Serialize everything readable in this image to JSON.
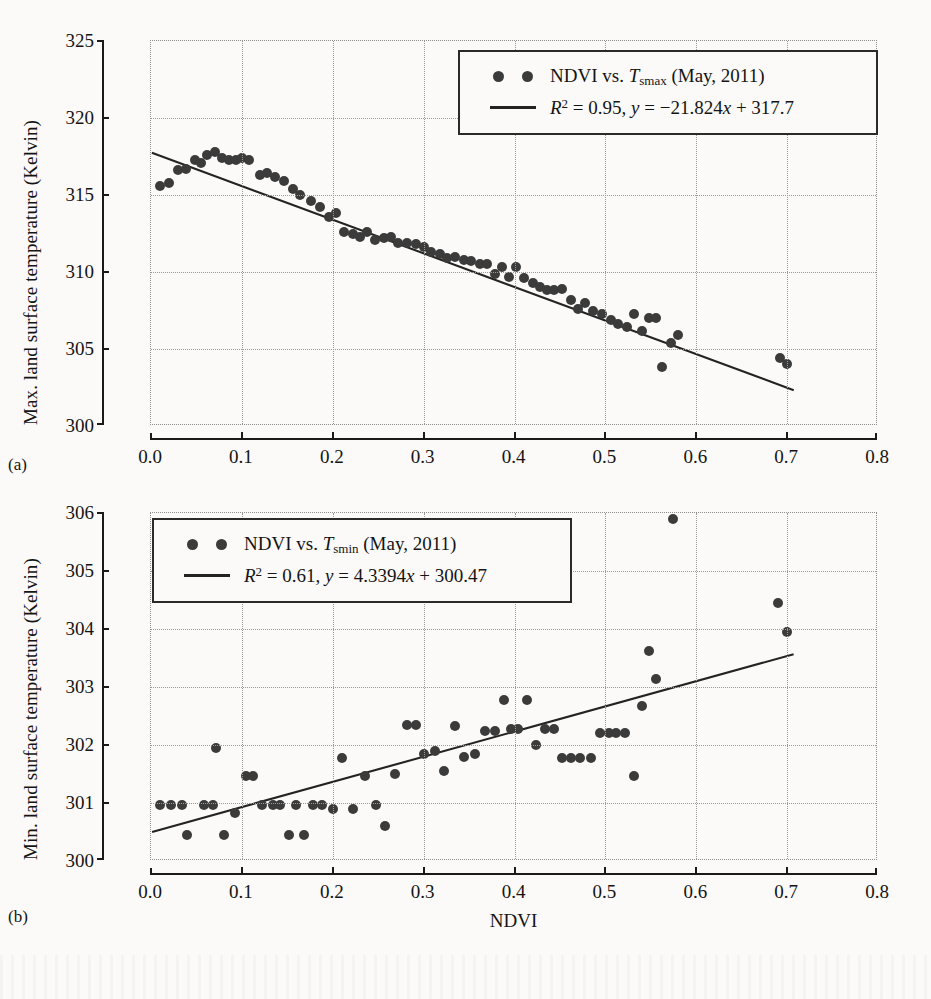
{
  "figure": {
    "background": "#fbfaf8",
    "marker_color": "#3b3b3b",
    "line_color": "#232323",
    "grid_color": "#9a9a9a",
    "panel_a_tag": "(a)",
    "panel_b_tag": "(b)"
  },
  "chart_data": [
    {
      "type": "scatter",
      "panel": "(a)",
      "title": "",
      "xlabel": "",
      "ylabel": "Max. land surface temperature (Kelvin)",
      "xlim": [
        0.0,
        0.8
      ],
      "ylim": [
        300,
        325
      ],
      "xticks": [
        "0.0",
        "0.1",
        "0.2",
        "0.3",
        "0.4",
        "0.5",
        "0.6",
        "0.7",
        "0.8"
      ],
      "xtick_values": [
        0.0,
        0.1,
        0.2,
        0.3,
        0.4,
        0.5,
        0.6,
        0.7,
        0.8
      ],
      "yticks": [
        "300",
        "305",
        "310",
        "315",
        "320",
        "325"
      ],
      "ytick_values": [
        300,
        305,
        310,
        315,
        320,
        325
      ],
      "grid": true,
      "legend_position": "top-right",
      "legend": [
        {
          "marker": "circle",
          "label": "NDVI vs. T_smax (May, 2011)"
        },
        {
          "marker": "line",
          "label": "R^2 = 0.95, y = -21.824x + 317.7"
        }
      ],
      "fit": {
        "slope": -21.824,
        "intercept": 317.7,
        "r2": 0.95
      },
      "series_name": "NDVI vs. Tsmax (May, 2011)",
      "points": [
        [
          0.01,
          315.6
        ],
        [
          0.02,
          315.8
        ],
        [
          0.03,
          316.6
        ],
        [
          0.038,
          316.7
        ],
        [
          0.048,
          317.3
        ],
        [
          0.055,
          317.1
        ],
        [
          0.062,
          317.6
        ],
        [
          0.07,
          317.8
        ],
        [
          0.078,
          317.4
        ],
        [
          0.086,
          317.3
        ],
        [
          0.094,
          317.3
        ],
        [
          0.1,
          317.4
        ],
        [
          0.108,
          317.3
        ],
        [
          0.12,
          316.3
        ],
        [
          0.128,
          316.4
        ],
        [
          0.136,
          316.2
        ],
        [
          0.146,
          315.9
        ],
        [
          0.156,
          315.4
        ],
        [
          0.164,
          315.0
        ],
        [
          0.176,
          314.6
        ],
        [
          0.186,
          314.2
        ],
        [
          0.196,
          313.6
        ],
        [
          0.204,
          313.8
        ],
        [
          0.212,
          312.6
        ],
        [
          0.222,
          312.5
        ],
        [
          0.23,
          312.3
        ],
        [
          0.238,
          312.6
        ],
        [
          0.246,
          312.1
        ],
        [
          0.256,
          312.2
        ],
        [
          0.264,
          312.3
        ],
        [
          0.272,
          311.9
        ],
        [
          0.282,
          311.9
        ],
        [
          0.292,
          311.8
        ],
        [
          0.3,
          311.6
        ],
        [
          0.308,
          311.3
        ],
        [
          0.318,
          311.2
        ],
        [
          0.326,
          310.9
        ],
        [
          0.334,
          311.0
        ],
        [
          0.344,
          310.8
        ],
        [
          0.352,
          310.7
        ],
        [
          0.362,
          310.5
        ],
        [
          0.37,
          310.5
        ],
        [
          0.378,
          309.9
        ],
        [
          0.386,
          310.3
        ],
        [
          0.394,
          309.7
        ],
        [
          0.402,
          310.3
        ],
        [
          0.41,
          309.6
        ],
        [
          0.42,
          309.3
        ],
        [
          0.428,
          309.0
        ],
        [
          0.436,
          308.8
        ],
        [
          0.444,
          308.8
        ],
        [
          0.452,
          308.9
        ],
        [
          0.462,
          308.2
        ],
        [
          0.47,
          307.6
        ],
        [
          0.478,
          308.0
        ],
        [
          0.486,
          307.5
        ],
        [
          0.496,
          307.3
        ],
        [
          0.506,
          306.9
        ],
        [
          0.514,
          306.6
        ],
        [
          0.524,
          306.4
        ],
        [
          0.532,
          307.3
        ],
        [
          0.54,
          306.2
        ],
        [
          0.548,
          307.0
        ],
        [
          0.556,
          307.0
        ],
        [
          0.562,
          303.8
        ],
        [
          0.572,
          305.4
        ],
        [
          0.58,
          305.9
        ],
        [
          0.692,
          304.4
        ],
        [
          0.7,
          304.0
        ]
      ]
    },
    {
      "type": "scatter",
      "panel": "(b)",
      "title": "",
      "xlabel": "NDVI",
      "ylabel": "Min. land surface temperature (Kelvin)",
      "xlim": [
        0.0,
        0.8
      ],
      "ylim": [
        300,
        306
      ],
      "xticks": [
        "0.0",
        "0.1",
        "0.2",
        "0.3",
        "0.4",
        "0.5",
        "0.6",
        "0.7",
        "0.8"
      ],
      "xtick_values": [
        0.0,
        0.1,
        0.2,
        0.3,
        0.4,
        0.5,
        0.6,
        0.7,
        0.8
      ],
      "yticks": [
        "300",
        "301",
        "302",
        "303",
        "304",
        "305",
        "306"
      ],
      "ytick_values": [
        300,
        301,
        302,
        303,
        304,
        305,
        306
      ],
      "grid": true,
      "legend_position": "top-left",
      "legend": [
        {
          "marker": "circle",
          "label": "NDVI vs. T_smin (May, 2011)"
        },
        {
          "marker": "line",
          "label": "R^2 = 0.61, y = 4.3394x + 300.47"
        }
      ],
      "fit": {
        "slope": 4.3394,
        "intercept": 300.47,
        "r2": 0.61
      },
      "series_name": "NDVI vs. Tsmin (May, 2011)",
      "points": [
        [
          0.01,
          300.97
        ],
        [
          0.022,
          300.97
        ],
        [
          0.034,
          300.97
        ],
        [
          0.04,
          300.45
        ],
        [
          0.058,
          300.97
        ],
        [
          0.068,
          300.97
        ],
        [
          0.072,
          301.95
        ],
        [
          0.08,
          300.45
        ],
        [
          0.092,
          300.83
        ],
        [
          0.104,
          301.47
        ],
        [
          0.112,
          301.47
        ],
        [
          0.122,
          300.97
        ],
        [
          0.134,
          300.97
        ],
        [
          0.142,
          300.97
        ],
        [
          0.152,
          300.45
        ],
        [
          0.16,
          300.97
        ],
        [
          0.168,
          300.45
        ],
        [
          0.178,
          300.97
        ],
        [
          0.188,
          300.97
        ],
        [
          0.2,
          300.9
        ],
        [
          0.21,
          301.77
        ],
        [
          0.222,
          300.9
        ],
        [
          0.236,
          301.47
        ],
        [
          0.248,
          300.97
        ],
        [
          0.258,
          300.6
        ],
        [
          0.268,
          301.5
        ],
        [
          0.282,
          302.35
        ],
        [
          0.292,
          302.35
        ],
        [
          0.3,
          301.85
        ],
        [
          0.312,
          301.9
        ],
        [
          0.322,
          301.55
        ],
        [
          0.334,
          302.33
        ],
        [
          0.344,
          301.8
        ],
        [
          0.356,
          301.85
        ],
        [
          0.368,
          302.25
        ],
        [
          0.378,
          302.25
        ],
        [
          0.388,
          302.78
        ],
        [
          0.396,
          302.28
        ],
        [
          0.404,
          302.28
        ],
        [
          0.414,
          302.78
        ],
        [
          0.424,
          302.0
        ],
        [
          0.434,
          302.28
        ],
        [
          0.444,
          302.28
        ],
        [
          0.452,
          301.78
        ],
        [
          0.462,
          301.78
        ],
        [
          0.472,
          301.78
        ],
        [
          0.484,
          301.78
        ],
        [
          0.494,
          302.2
        ],
        [
          0.504,
          302.2
        ],
        [
          0.512,
          302.2
        ],
        [
          0.522,
          302.2
        ],
        [
          0.532,
          301.47
        ],
        [
          0.54,
          302.68
        ],
        [
          0.548,
          303.62
        ],
        [
          0.556,
          303.13
        ],
        [
          0.574,
          305.9
        ],
        [
          0.69,
          304.45
        ],
        [
          0.7,
          303.95
        ]
      ]
    }
  ]
}
